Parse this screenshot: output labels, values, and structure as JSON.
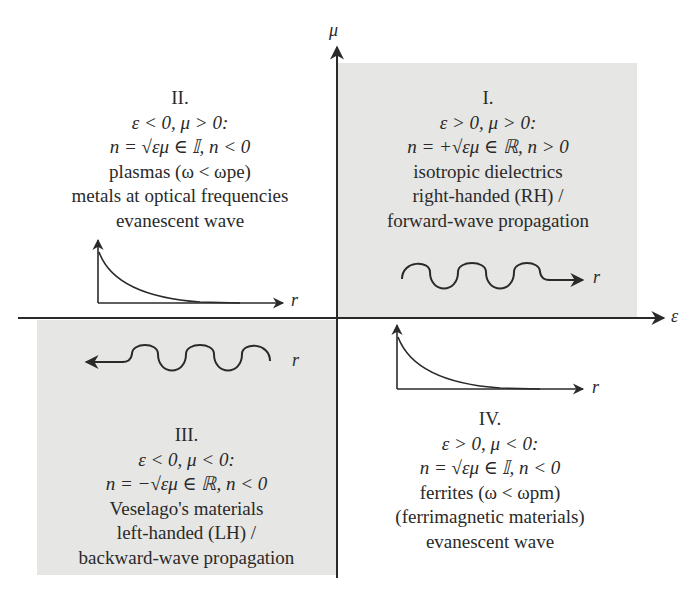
{
  "axes": {
    "horizontal": {
      "label": "ε"
    },
    "vertical": {
      "label": "μ"
    }
  },
  "quadrants": [
    {
      "id": "I",
      "numeral": "I.",
      "condition": "ε > 0, μ > 0:",
      "index": "n = +√εμ ∈ ℝ, n > 0",
      "lines": [
        "isotropic dielectrics",
        "right-handed (RH) /",
        "forward-wave propagation"
      ],
      "wave_label": "r",
      "wave_type": "propagating-forward",
      "shaded": true
    },
    {
      "id": "II",
      "numeral": "II.",
      "condition": "ε < 0, μ > 0:",
      "index": "n = √εμ ∈ 𝕀, n < 0",
      "lines": [
        "plasmas (ω < ωpe)",
        "metals at optical frequencies",
        "evanescent wave"
      ],
      "wave_label": "r",
      "wave_type": "evanescent",
      "shaded": false
    },
    {
      "id": "III",
      "numeral": "III.",
      "condition": "ε < 0, μ < 0:",
      "index": "n = −√εμ ∈ ℝ, n < 0",
      "lines": [
        "Veselago's materials",
        "left-handed (LH) /",
        "backward-wave propagation"
      ],
      "wave_label": "r",
      "wave_type": "propagating-backward",
      "shaded": true
    },
    {
      "id": "IV",
      "numeral": "IV.",
      "condition": "ε > 0, μ < 0:",
      "index": "n = √εμ ∈ 𝕀, n < 0",
      "lines": [
        "ferrites (ω < ωpm)",
        "(ferrimagnetic materials)",
        "evanescent wave"
      ],
      "wave_label": "r",
      "wave_type": "evanescent",
      "shaded": false
    }
  ],
  "colors": {
    "shade": "#e6e6e4",
    "ink": "#2a2a2a",
    "background": "#ffffff"
  }
}
